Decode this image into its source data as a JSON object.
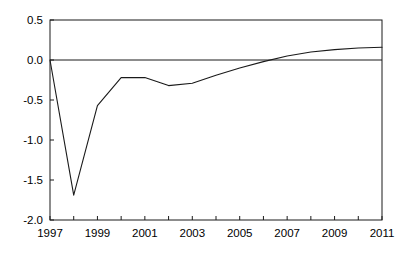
{
  "chart_data": {
    "type": "line",
    "title": "",
    "subtitle": "",
    "xlabel": "",
    "ylabel": "",
    "x": [
      1997,
      1998,
      1999,
      2000,
      2001,
      2002,
      2003,
      2004,
      2005,
      2006,
      2007,
      2008,
      2009,
      2010,
      2011
    ],
    "values": [
      0.0,
      -1.69,
      -0.57,
      -0.22,
      -0.22,
      -0.32,
      -0.29,
      -0.19,
      -0.1,
      -0.02,
      0.05,
      0.1,
      0.13,
      0.15,
      0.16
    ],
    "series": [
      {
        "name": "series-1",
        "values": [
          0.0,
          -1.69,
          -0.57,
          -0.22,
          -0.22,
          -0.32,
          -0.29,
          -0.19,
          -0.1,
          -0.02,
          0.05,
          0.1,
          0.13,
          0.15,
          0.16
        ]
      }
    ],
    "xlim": [
      1997,
      2011
    ],
    "ylim": [
      -2.0,
      0.5
    ],
    "ytick_labels": [
      "0.5",
      "0.0",
      "-0.5",
      "-1.0",
      "-1.5",
      "-2.0"
    ],
    "ytick_values": [
      0.5,
      0.0,
      -0.5,
      -1.0,
      -1.5,
      -2.0
    ],
    "xtick_labels": [
      "1997",
      "1999",
      "2001",
      "2003",
      "2005",
      "2007",
      "2009",
      "2011"
    ],
    "xtick_values": [
      1997,
      1999,
      2001,
      2003,
      2005,
      2007,
      2009,
      2011
    ],
    "xtick_minor_values": [
      1998,
      2000,
      2002,
      2004,
      2006,
      2008,
      2010
    ],
    "grid": false,
    "legend": false,
    "legend_position": "none",
    "zero_line": 0.0,
    "annotations": [],
    "colors": {
      "line": "#1a1a1a",
      "frame": "#1a1a1a",
      "zero_line": "#1a1a1a",
      "background": "#ffffff",
      "text": "#000000"
    }
  }
}
